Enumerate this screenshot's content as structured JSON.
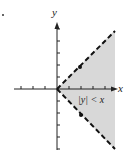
{
  "figure": {
    "axis_x_label": "x",
    "axis_y_label": "y",
    "region_label": "|y| < x",
    "region_fill": "#d6d6d6",
    "boundary_style": "dashed",
    "boundary_lines": [
      "y = x",
      "y = -x"
    ],
    "marker": "."
  }
}
